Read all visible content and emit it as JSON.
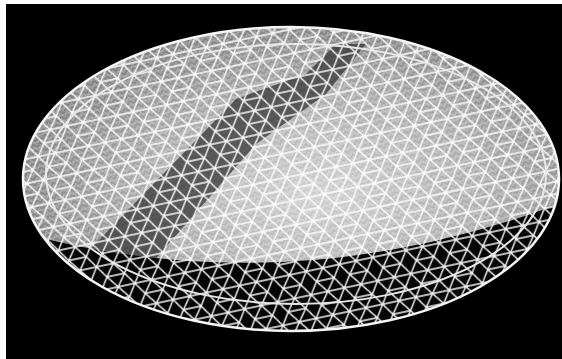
{
  "image": {
    "subject": "geodesic dome lattice rendering",
    "alt": "Wireframe rendering of a shallow geodesic dome with white struts on a black background",
    "background_color": "#000000",
    "border_color": "#ffffff",
    "strut_color": "#f2f2f2",
    "shadow_color": "#3a3a3a"
  }
}
